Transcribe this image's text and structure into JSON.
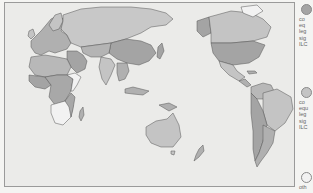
{
  "colors": {
    "dark": "#a4a4a4",
    "medium": "#c4c4c4",
    "light": "#f2f2f2",
    "ocean": "#ebebe9",
    "border": "#555555"
  },
  "legend": {
    "items": [
      {
        "swatch": "dark",
        "text": "co\neq\nleg\nsig\nILC"
      },
      {
        "swatch": "medium",
        "text": "co\nequ\nleg\nsig\nILC"
      },
      {
        "swatch": "light",
        "text": "oth"
      }
    ]
  }
}
